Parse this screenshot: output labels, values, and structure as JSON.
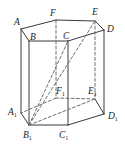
{
  "figure": {
    "kind": "geometry-diagram",
    "shape": "hexagonal-prism",
    "width": 125,
    "height": 152,
    "background_color": "#ffffff",
    "stroke_color": "#3a3a3a",
    "stroke_color_dashed": "#6e6e6e",
    "label_color": "#1d1d1d",
    "stroke_width": 1.0,
    "dash_pattern": "3 2.2"
  },
  "labels": {
    "A": {
      "text": "A",
      "sub": "",
      "x": 14,
      "y": 18
    },
    "B": {
      "text": "B",
      "sub": "",
      "x": 30,
      "y": 33
    },
    "C": {
      "text": "C",
      "sub": "",
      "x": 63,
      "y": 32
    },
    "D": {
      "text": "D",
      "sub": "",
      "x": 107,
      "y": 25
    },
    "E": {
      "text": "E",
      "sub": "",
      "x": 92,
      "y": 8
    },
    "F": {
      "text": "F",
      "sub": "",
      "x": 50,
      "y": 9
    },
    "A1": {
      "text": "A",
      "sub": "1",
      "x": 8,
      "y": 108
    },
    "B1": {
      "text": "B",
      "sub": "1",
      "x": 23,
      "y": 131
    },
    "C1": {
      "text": "C",
      "sub": "1",
      "x": 59,
      "y": 131
    },
    "D1": {
      "text": "D",
      "sub": "1",
      "x": 108,
      "y": 112
    },
    "E1": {
      "text": "E",
      "sub": "1",
      "x": 88,
      "y": 87
    },
    "F1": {
      "text": "F",
      "sub": "1",
      "x": 56,
      "y": 87
    }
  },
  "vertices": {
    "A": {
      "x": 21,
      "y": 29
    },
    "B": {
      "x": 29,
      "y": 41
    },
    "C": {
      "x": 68,
      "y": 41
    },
    "D": {
      "x": 104,
      "y": 30
    },
    "E": {
      "x": 95,
      "y": 21
    },
    "F": {
      "x": 56,
      "y": 20
    },
    "A1": {
      "x": 21,
      "y": 113
    },
    "B1": {
      "x": 29,
      "y": 125
    },
    "C1": {
      "x": 68,
      "y": 125
    },
    "D1": {
      "x": 104,
      "y": 114
    },
    "E1": {
      "x": 95,
      "y": 99
    },
    "F1": {
      "x": 56,
      "y": 98
    }
  },
  "edges": {
    "top_face_solid": [
      {
        "name": "edge-A-B",
        "from": "A",
        "to": "B"
      },
      {
        "name": "edge-B-C",
        "from": "B",
        "to": "C"
      },
      {
        "name": "edge-C-D",
        "from": "C",
        "to": "D"
      },
      {
        "name": "edge-D-E",
        "from": "D",
        "to": "E"
      },
      {
        "name": "edge-E-F",
        "from": "E",
        "to": "F"
      },
      {
        "name": "edge-F-A",
        "from": "F",
        "to": "A"
      }
    ],
    "bottom_face_solid": [
      {
        "name": "edge-A1-B1",
        "from": "A1",
        "to": "B1"
      },
      {
        "name": "edge-B1-C1",
        "from": "B1",
        "to": "C1"
      },
      {
        "name": "edge-C1-D1",
        "from": "C1",
        "to": "D1"
      },
      {
        "name": "edge-D1-E1",
        "from": "D1",
        "to": "E1"
      }
    ],
    "bottom_face_dashed": [
      {
        "name": "edge-E1-F1",
        "from": "E1",
        "to": "F1"
      },
      {
        "name": "edge-F1-A1",
        "from": "F1",
        "to": "A1"
      }
    ],
    "vertical_solid": [
      {
        "name": "edge-A-A1",
        "from": "A",
        "to": "A1"
      },
      {
        "name": "edge-B-B1",
        "from": "B",
        "to": "B1"
      },
      {
        "name": "edge-C-C1",
        "from": "C",
        "to": "C1"
      },
      {
        "name": "edge-D-D1",
        "from": "D",
        "to": "D1"
      }
    ],
    "vertical_dashed": [
      {
        "name": "edge-F-F1",
        "from": "F",
        "to": "F1"
      },
      {
        "name": "edge-E-E1",
        "from": "E",
        "to": "E1"
      }
    ],
    "diagonals_dashed": [
      {
        "name": "diagonal-B1-E",
        "from": "B1",
        "to": "E"
      },
      {
        "name": "diagonal-B1-C",
        "from": "B1",
        "to": "C"
      },
      {
        "name": "diagonal-B1-E1",
        "from": "B1",
        "to": "E1"
      }
    ]
  }
}
